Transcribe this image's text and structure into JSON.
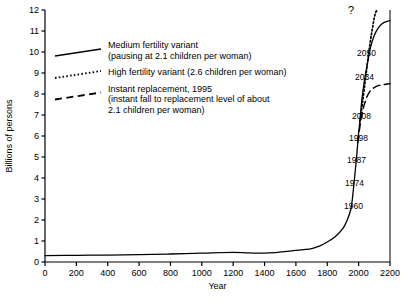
{
  "chart_data": {
    "type": "line",
    "title": "",
    "xlabel": "Year",
    "ylabel": "Billions of persons",
    "xlim": [
      0,
      2200
    ],
    "ylim": [
      0,
      12
    ],
    "grid": false,
    "legend_position": "upper-left-inside",
    "xticks": [
      "0",
      "200",
      "400",
      "600",
      "800",
      "1000",
      "1200",
      "1400",
      "1600",
      "1800",
      "2000",
      "2200"
    ],
    "xtick_values": [
      0,
      200,
      400,
      600,
      800,
      1000,
      1200,
      1400,
      1600,
      1800,
      2000,
      2200
    ],
    "yticks": [
      "0",
      "1",
      "2",
      "3",
      "4",
      "5",
      "6",
      "7",
      "8",
      "9",
      "10",
      "11",
      "12"
    ],
    "ytick_values": [
      0,
      1,
      2,
      3,
      4,
      5,
      6,
      7,
      8,
      9,
      10,
      11,
      12
    ],
    "series": [
      {
        "name": "Medium fertility variant",
        "style": "solid",
        "x": [
          0,
          200,
          400,
          600,
          800,
          1000,
          1200,
          1400,
          1600,
          1700,
          1750,
          1800,
          1850,
          1900,
          1927,
          1950,
          1960,
          1974,
          1987,
          1998,
          2008,
          2020,
          2034,
          2050,
          2075,
          2100,
          2130,
          2160,
          2200
        ],
        "y": [
          0.3,
          0.32,
          0.33,
          0.35,
          0.38,
          0.42,
          0.46,
          0.42,
          0.55,
          0.64,
          0.76,
          0.95,
          1.2,
          1.6,
          2.0,
          2.5,
          3.0,
          4.0,
          5.0,
          6.0,
          6.7,
          7.7,
          8.5,
          9.2,
          10.2,
          10.8,
          11.2,
          11.4,
          11.5
        ]
      },
      {
        "name": "High fertility variant",
        "style": "dotted",
        "x": [
          2008,
          2025,
          2045,
          2065,
          2085,
          2105,
          2120
        ],
        "y": [
          6.7,
          7.6,
          8.8,
          10.0,
          11.0,
          11.8,
          12.0
        ]
      },
      {
        "name": "Instant replacement, 1995",
        "style": "dashed",
        "x": [
          1995,
          2015,
          2040,
          2070,
          2110,
          2160,
          2200
        ],
        "y": [
          5.7,
          6.8,
          7.6,
          8.1,
          8.35,
          8.45,
          8.5
        ]
      }
    ],
    "legend": [
      {
        "style": "solid",
        "lines": [
          "Medium fertility variant",
          "(pausing at 2.1 children per woman)"
        ]
      },
      {
        "style": "dotted",
        "lines": [
          "High fertility variant (2.6 children per woman)"
        ]
      },
      {
        "style": "dashed",
        "lines": [
          "Instant replacement, 1995",
          "(instant fall to replacement level of about",
          "2.1 children per woman)"
        ]
      }
    ],
    "annotations": [
      {
        "label": "?",
        "x": 348,
        "y": 14
      },
      {
        "label": "2050",
        "x": 357,
        "y": 56
      },
      {
        "label": "2034",
        "x": 355,
        "y": 80
      },
      {
        "label": "2008",
        "x": 352,
        "y": 119
      },
      {
        "label": "1998",
        "x": 349,
        "y": 141
      },
      {
        "label": "1987",
        "x": 347,
        "y": 163
      },
      {
        "label": "1974",
        "x": 345,
        "y": 186
      },
      {
        "label": "1960",
        "x": 344,
        "y": 209
      }
    ],
    "colors": {
      "line": "#000000",
      "axis": "#000000",
      "background": "#ffffff",
      "text": "#000000"
    }
  }
}
